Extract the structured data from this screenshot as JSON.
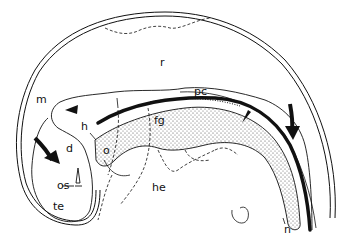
{
  "diagram": {
    "type": "anatomical-sagittal-section",
    "colors": {
      "ink": "#111111",
      "background": "#ffffff",
      "stipple": "#444444"
    },
    "labels": {
      "r": "r",
      "m": "m",
      "pc": "pc",
      "h": "h",
      "fg": "fg",
      "o": "o",
      "d": "d",
      "os": "os",
      "te": "te",
      "he": "he",
      "n": "n"
    },
    "arrows": [
      {
        "id": "left-curved-arrow",
        "direction": "down-right"
      },
      {
        "id": "right-curved-arrow",
        "direction": "down"
      }
    ],
    "arrowheads": [
      {
        "id": "left-triangle-marker"
      },
      {
        "id": "right-triangle-marker"
      }
    ]
  }
}
